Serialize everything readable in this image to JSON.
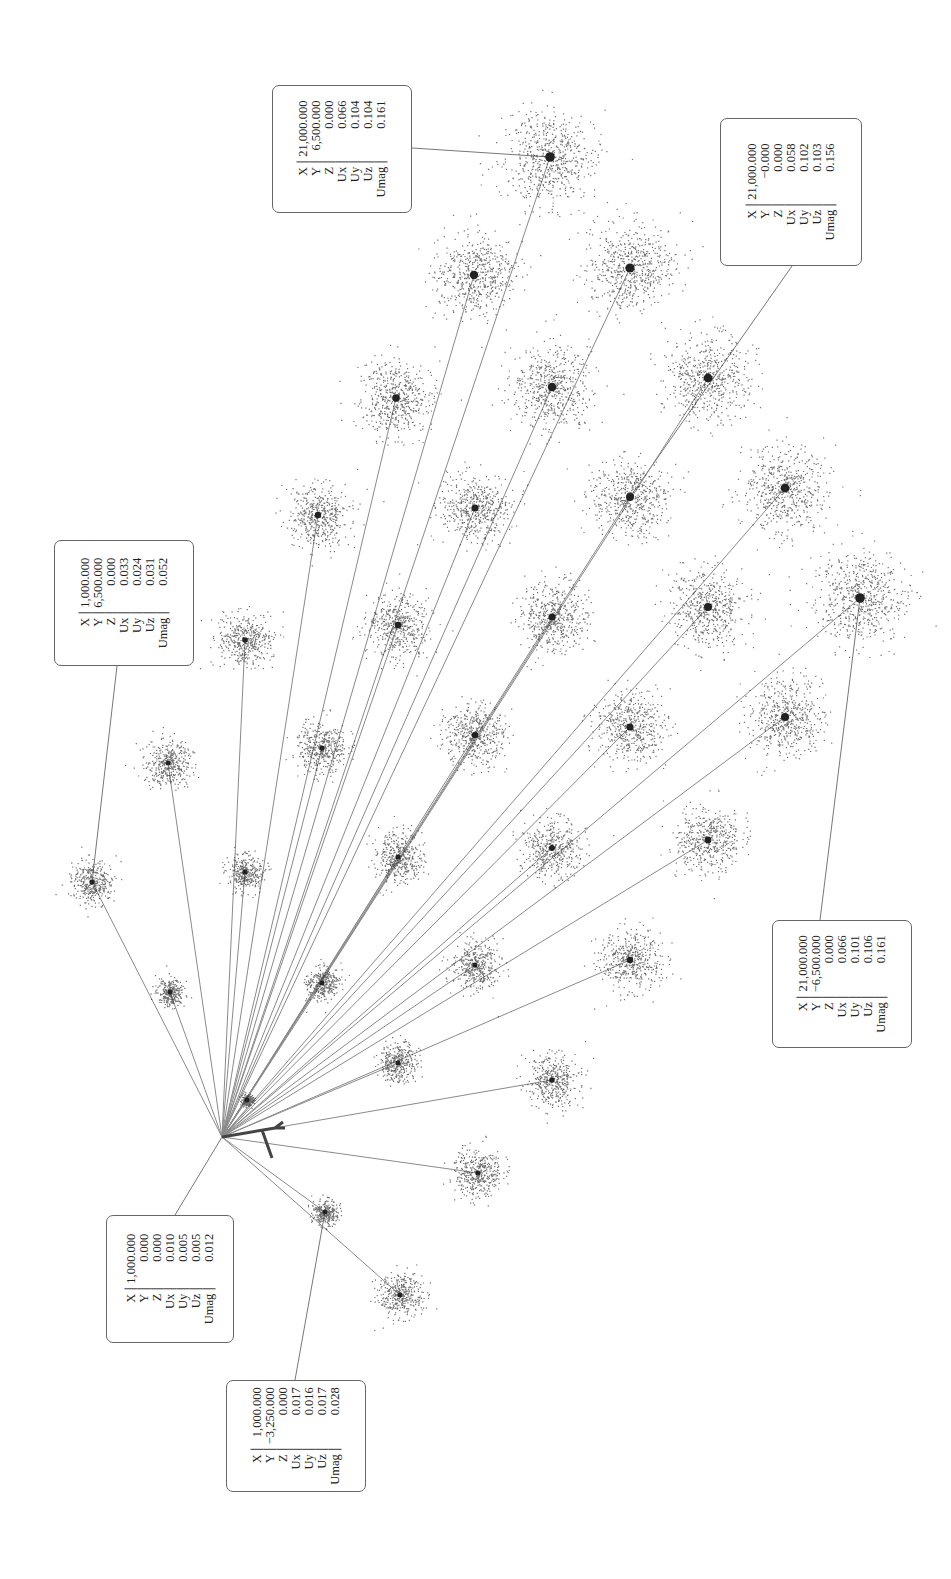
{
  "chart_data": {
    "type": "scatter",
    "title": "",
    "orientation": "rotated 90° counter-clockwise on page",
    "origin": {
      "x": 0,
      "y": 0,
      "z": 0
    },
    "grid": {
      "x_values": [
        1000,
        3000,
        5000,
        7000,
        9000,
        11000,
        13000,
        15000,
        17000,
        19000,
        21000
      ],
      "y_range": [
        -6500,
        6500
      ]
    },
    "callouts": [
      {
        "id": "c1",
        "X": "21,000.000",
        "Y": "6,500.000",
        "Z": "0.000",
        "Ux": "0.066",
        "Uy": "0.104",
        "Uz": "0.104",
        "Umag": "0.161"
      },
      {
        "id": "c2",
        "X": "21,000.000",
        "Y": "−0.000",
        "Z": "0.000",
        "Ux": "0.058",
        "Uy": "0.102",
        "Uz": "0.103",
        "Umag": "0.156"
      },
      {
        "id": "c3",
        "X": "1,000.000",
        "Y": "6,500.000",
        "Z": "0.000",
        "Ux": "0.033",
        "Uy": "0.024",
        "Uz": "0.031",
        "Umag": "0.052"
      },
      {
        "id": "c4",
        "X": "21,000.000",
        "Y": "−6,500.000",
        "Z": "0.000",
        "Ux": "0.066",
        "Uy": "0.101",
        "Uz": "0.106",
        "Umag": "0.161"
      },
      {
        "id": "c5",
        "X": "1,000.000",
        "Y": "0.000",
        "Z": "0.000",
        "Ux": "0.010",
        "Uy": "0.005",
        "Uz": "0.005",
        "Umag": "0.012"
      },
      {
        "id": "c6",
        "X": "1,000.000",
        "Y": "−3,250.000",
        "Z": "0.000",
        "Ux": "0.017",
        "Uy": "0.016",
        "Uz": "0.017",
        "Umag": "0.028"
      }
    ],
    "labels": [
      "X",
      "Y",
      "Z",
      "Ux",
      "Uy",
      "Uz",
      "Umag"
    ]
  },
  "plot": {
    "origin_px": [
      222,
      1137
    ],
    "line_color": "#8a8a8a",
    "point_color": "#333333",
    "clusters": [
      {
        "x": 92,
        "y": 882,
        "r": 22
      },
      {
        "x": 170,
        "y": 992,
        "r": 14
      },
      {
        "x": 168,
        "y": 763,
        "r": 24
      },
      {
        "x": 245,
        "y": 872,
        "r": 18
      },
      {
        "x": 245,
        "y": 640,
        "r": 28
      },
      {
        "x": 247,
        "y": 1100,
        "r": 6
      },
      {
        "x": 322,
        "y": 983,
        "r": 17
      },
      {
        "x": 322,
        "y": 748,
        "r": 26
      },
      {
        "x": 318,
        "y": 515,
        "r": 32
      },
      {
        "x": 325,
        "y": 1212,
        "r": 13
      },
      {
        "x": 398,
        "y": 1063,
        "r": 20
      },
      {
        "x": 398,
        "y": 857,
        "r": 26
      },
      {
        "x": 398,
        "y": 625,
        "r": 32
      },
      {
        "x": 396,
        "y": 398,
        "r": 38
      },
      {
        "x": 400,
        "y": 1295,
        "r": 23
      },
      {
        "x": 475,
        "y": 965,
        "r": 25
      },
      {
        "x": 475,
        "y": 735,
        "r": 32
      },
      {
        "x": 475,
        "y": 508,
        "r": 36
      },
      {
        "x": 474,
        "y": 275,
        "r": 42
      },
      {
        "x": 478,
        "y": 1173,
        "r": 25
      },
      {
        "x": 552,
        "y": 1080,
        "r": 27
      },
      {
        "x": 552,
        "y": 848,
        "r": 30
      },
      {
        "x": 552,
        "y": 617,
        "r": 36
      },
      {
        "x": 552,
        "y": 387,
        "r": 42
      },
      {
        "x": 550,
        "y": 157,
        "r": 48
      },
      {
        "x": 630,
        "y": 960,
        "r": 32
      },
      {
        "x": 630,
        "y": 727,
        "r": 36
      },
      {
        "x": 630,
        "y": 497,
        "r": 40
      },
      {
        "x": 630,
        "y": 268,
        "r": 46
      },
      {
        "x": 708,
        "y": 840,
        "r": 34
      },
      {
        "x": 708,
        "y": 607,
        "r": 40
      },
      {
        "x": 708,
        "y": 378,
        "r": 44
      },
      {
        "x": 785,
        "y": 717,
        "r": 40
      },
      {
        "x": 785,
        "y": 488,
        "r": 44
      },
      {
        "x": 860,
        "y": 598,
        "r": 48
      }
    ],
    "callout_boxes": [
      {
        "id": "c1",
        "left": 272,
        "top": 85,
        "width": 140,
        "height": 128,
        "leader": [
          [
            412,
            148
          ],
          [
            550,
            157
          ]
        ]
      },
      {
        "id": "c2",
        "left": 720,
        "top": 118,
        "width": 142,
        "height": 148,
        "leader": [
          [
            792,
            266
          ],
          [
            630,
            497
          ]
        ]
      },
      {
        "id": "c3",
        "left": 54,
        "top": 540,
        "width": 140,
        "height": 126,
        "leader": [
          [
            117,
            666
          ],
          [
            92,
            882
          ]
        ]
      },
      {
        "id": "c4",
        "left": 772,
        "top": 920,
        "width": 140,
        "height": 128,
        "leader": [
          [
            820,
            920
          ],
          [
            860,
            598
          ]
        ]
      },
      {
        "id": "c5",
        "left": 106,
        "top": 1215,
        "width": 128,
        "height": 128,
        "leader": [
          [
            175,
            1215
          ],
          [
            222,
            1137
          ]
        ]
      },
      {
        "id": "c6",
        "left": 226,
        "top": 1380,
        "width": 140,
        "height": 112,
        "leader": [
          [
            295,
            1380
          ],
          [
            325,
            1212
          ]
        ]
      }
    ]
  }
}
